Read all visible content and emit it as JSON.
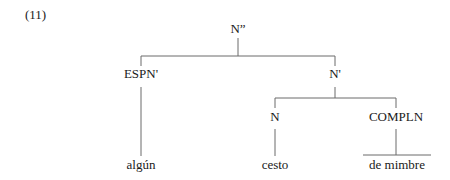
{
  "example_number": "(11)",
  "tree": {
    "root": {
      "label": "N''",
      "display": "N”"
    },
    "nodes": {
      "espn_bar": "ESPN'",
      "n_bar": "N'",
      "n": "N",
      "compln": "COMPLN"
    },
    "leaves": {
      "espn_leaf": "algún",
      "n_leaf": "cesto",
      "compln_leaf": "de mimbre"
    },
    "structure": {
      "label": "N''",
      "children": [
        {
          "label": "ESPN'",
          "children": [
            {
              "label": "algún"
            }
          ]
        },
        {
          "label": "N'",
          "children": [
            {
              "label": "N",
              "children": [
                {
                  "label": "cesto"
                }
              ]
            },
            {
              "label": "COMPLN",
              "children": [
                {
                  "label": "de mimbre",
                  "triangle_roof": true
                }
              ]
            }
          ]
        }
      ]
    }
  },
  "colors": {
    "text": "#1a1a1a",
    "lines": "#6a6a6a",
    "background": "#ffffff"
  }
}
